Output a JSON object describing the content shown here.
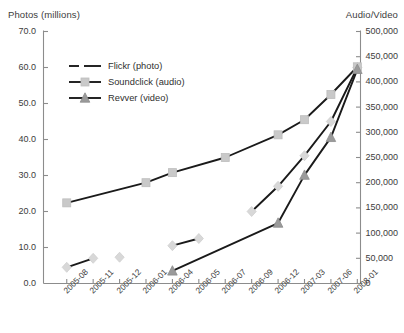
{
  "axes": {
    "left_title": "Photos (millions)",
    "right_title": "Audio/Video",
    "left_ticks": [
      "70.0",
      "60.0",
      "50.0",
      "40.0",
      "30.0",
      "20.0",
      "10.0",
      "0.0"
    ],
    "right_ticks": [
      "500,000",
      "450,000",
      "400,000",
      "350,000",
      "300,000",
      "250,000",
      "200,000",
      "150,000",
      "100,000",
      "50,000",
      "0"
    ]
  },
  "legend": {
    "items": [
      {
        "label": "Flickr (photo)",
        "marker": "diamond-marker",
        "color": "#d8d8d8"
      },
      {
        "label": "Soundclick (audio)",
        "marker": "square-marker",
        "color": "#c9c9c9"
      },
      {
        "label": "Revver (video)",
        "marker": "triangle-marker",
        "color": "#9a9a9a"
      }
    ]
  },
  "chart_data": {
    "type": "line",
    "title": "",
    "xlabel": "",
    "ylabel": "Photos (millions)",
    "y2label": "Audio/Video",
    "grid": false,
    "legend_position": "upper-left-inside",
    "ylim": [
      0,
      70
    ],
    "y2lim": [
      0,
      500000
    ],
    "categories": [
      "2005-08",
      "2005-11",
      "2005-12",
      "2006-01",
      "2006-04",
      "2006-05",
      "2006-07",
      "2006-09",
      "2006-12",
      "2007-03",
      "2007-06",
      "2008-01"
    ],
    "series": [
      {
        "name": "Flickr (photo)",
        "axis": "left",
        "marker": "diamond",
        "line_style": "dashed",
        "color": "#d8d8d8",
        "line_color": "#1a1a1a",
        "points": [
          {
            "x": "2005-08",
            "y": 4.5
          },
          {
            "x": "2005-11",
            "y": 7.0
          },
          {
            "x": "2005-12",
            "y": null
          },
          {
            "x": "2006-01",
            "y": null
          },
          {
            "x": "2006-04",
            "y": 10.5
          },
          {
            "x": "2006-05",
            "y": 12.5
          },
          {
            "x": "2006-07",
            "y": null
          },
          {
            "x": "2006-09",
            "y": 20.0
          },
          {
            "x": "2006-12",
            "y": 27.0
          },
          {
            "x": "2007-03",
            "y": 35.5
          },
          {
            "x": "2007-06",
            "y": 45.0
          },
          {
            "x": "2008-01",
            "y": 60.0
          }
        ],
        "isolated_points": [
          {
            "x": "2005-12",
            "y": 7.3
          }
        ]
      },
      {
        "name": "Soundclick (audio)",
        "axis": "right",
        "marker": "square",
        "line_style": "solid",
        "color": "#c9c9c9",
        "line_color": "#1a1a1a",
        "points": [
          {
            "x": "2005-08",
            "y": 160000
          },
          {
            "x": "2006-01",
            "y": 200000
          },
          {
            "x": "2006-04",
            "y": 220000
          },
          {
            "x": "2006-07",
            "y": 250000
          },
          {
            "x": "2006-12",
            "y": 295000
          },
          {
            "x": "2007-03",
            "y": 325000
          },
          {
            "x": "2007-06",
            "y": 375000
          },
          {
            "x": "2008-01",
            "y": 430000
          }
        ]
      },
      {
        "name": "Revver (video)",
        "axis": "right",
        "marker": "triangle",
        "line_style": "solid",
        "color": "#9a9a9a",
        "line_color": "#1a1a1a",
        "points": [
          {
            "x": "2006-04",
            "y": 25000
          },
          {
            "x": "2006-12",
            "y": 120000
          },
          {
            "x": "2007-03",
            "y": 215000
          },
          {
            "x": "2007-06",
            "y": 290000
          },
          {
            "x": "2008-01",
            "y": 425000
          }
        ]
      }
    ]
  }
}
